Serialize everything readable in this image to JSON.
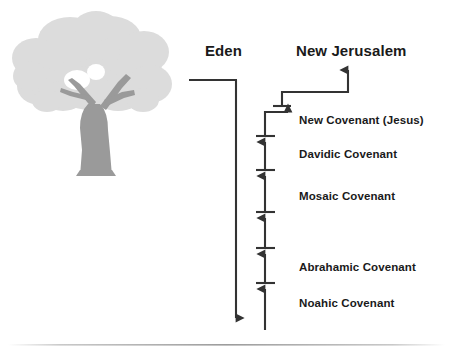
{
  "diagram": {
    "title_left": "Eden",
    "title_right": "New Jerusalem",
    "covenants": [
      {
        "label": "New Covenant (Jesus)"
      },
      {
        "label": "Davidic Covenant"
      },
      {
        "label": "Mosaic Covenant"
      },
      {
        "label": "Abrahamic Covenant"
      },
      {
        "label": "Noahic Covenant"
      }
    ],
    "colors": {
      "line": "#333333",
      "text": "#1a1a1a",
      "tree_canopy": "#dcdcdc",
      "tree_trunk": "#9a9a9a",
      "divider": "#b8b8b8",
      "background": "#ffffff"
    },
    "icons": {
      "tree": "tree-icon",
      "eden_arrow": "arrow-down-icon",
      "jerusalem_arrow": "arrow-up-icon"
    }
  }
}
